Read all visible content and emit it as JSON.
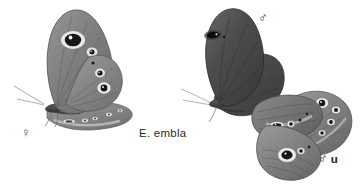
{
  "plate": {
    "background_color": "#ffffff",
    "ink_color": "#2a2a2a",
    "species_label": "E. embla",
    "labels": {
      "female_symbol": "♀",
      "male_symbol": "♂",
      "male_underside_symbol": "♂",
      "male_underside_suffix": "u"
    },
    "specimens": [
      {
        "name": "female-lateral",
        "sex": "♀",
        "view": "lateral, wings closed, underside visible",
        "position": "left",
        "wing_tone": "#8a8a8a",
        "eyespots": [
          {
            "part": "forewing",
            "count": 2,
            "note": "one large white-ringed black ocellus, one small"
          },
          {
            "part": "hindwing",
            "count": 3,
            "note": "graded small to large black ocelli with pale rings"
          },
          {
            "part": "lower-hindwing-band",
            "count": 4,
            "note": "pale elongate spots along margin"
          }
        ]
      },
      {
        "name": "male-upperside",
        "sex": "♂",
        "view": "upperside, wings spread",
        "position": "upper-right",
        "wing_tone": "#5a5a5a",
        "eyespots": [
          {
            "part": "forewing",
            "count": 1,
            "note": "dark elongate black ocellus near costa"
          }
        ]
      },
      {
        "name": "male-underside",
        "sex": "♂ u",
        "view": "underside wings",
        "position": "lower-right",
        "wing_tone": "#7b7b7b",
        "eyespots": [
          {
            "part": "forewing",
            "count": 3,
            "note": "black ocelli with white pupils in pale band"
          },
          {
            "part": "hindwing",
            "count": 5,
            "note": "row of white-ringed ocelli along outer margin"
          }
        ]
      }
    ]
  }
}
